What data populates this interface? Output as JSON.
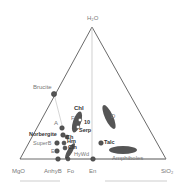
{
  "diagram": {
    "type": "ternary",
    "apices": {
      "top": "H₂O",
      "left": "MgO",
      "right": "SiO₂"
    },
    "colors": {
      "axis": "#444444",
      "tie": "#bbbbbb",
      "point": "#555555",
      "fill": "#555555"
    },
    "bottom_labels": {
      "anhyb": "AnhyB",
      "fo": "Fo",
      "en": "En"
    },
    "points": [
      {
        "name": "Brucite",
        "label": "Brucite"
      },
      {
        "name": "A",
        "label": "A"
      },
      {
        "name": "Norbergite",
        "label": "Norbergite"
      },
      {
        "name": "Ch",
        "label": "Ch"
      },
      {
        "name": "SuperB",
        "label": "SuperB"
      },
      {
        "name": "Hm",
        "label": "Hm"
      },
      {
        "name": "Cln",
        "label": "Cln"
      },
      {
        "name": "E",
        "label": "E"
      },
      {
        "name": "HyWd",
        "label": "HyWd"
      },
      {
        "name": "Chl",
        "label": "Chl"
      },
      {
        "name": "F",
        "label": "F"
      },
      {
        "name": "10",
        "label": "10"
      },
      {
        "name": "Serp",
        "label": "Serp"
      },
      {
        "name": "D",
        "label": "D"
      },
      {
        "name": "Talc",
        "label": "Talc"
      },
      {
        "name": "Amphiboles",
        "label": "Amphiboles"
      }
    ]
  }
}
